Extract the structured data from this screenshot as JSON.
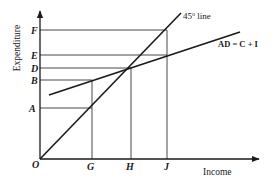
{
  "diagram": {
    "type": "keynesian-cross",
    "axes": {
      "x_label": "Income",
      "y_label": "Expenditure",
      "origin_label": "O"
    },
    "lines": {
      "forty_five": {
        "label_main": "45",
        "label_sup": "o",
        "label_tail": " line"
      },
      "aggregate_demand": {
        "label": "AD = C + I"
      }
    },
    "y_points": [
      {
        "label": "F"
      },
      {
        "label": "E"
      },
      {
        "label": "D"
      },
      {
        "label": "B"
      },
      {
        "label": "A"
      }
    ],
    "x_points": [
      {
        "label": "G"
      },
      {
        "label": "H"
      },
      {
        "label": "J"
      }
    ],
    "colors": {
      "ink": "#1a1a1a",
      "guide": "#333333",
      "background": "#ffffff"
    }
  }
}
